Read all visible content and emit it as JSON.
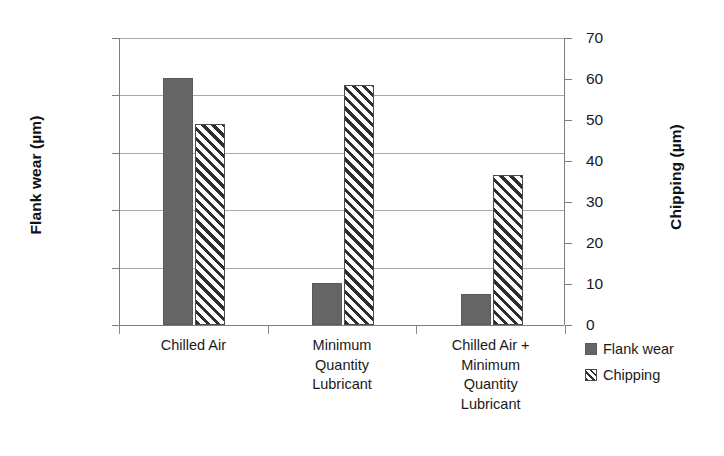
{
  "chart_data": {
    "type": "bar",
    "title": "",
    "xlabel": "",
    "categories": [
      "Chilled Air",
      "Minimum Quantity Lubricant",
      "Chilled Air + Minimum Quantity Lubricant"
    ],
    "category_lines": [
      [
        "Chilled Air"
      ],
      [
        "Minimum",
        "Quantity",
        "Lubricant"
      ],
      [
        "Chilled Air +",
        "Minimum",
        "Quantity",
        "Lubricant"
      ]
    ],
    "series": [
      {
        "name": "Flank wear",
        "axis": "left",
        "unit": "µm",
        "fill": "solid",
        "color": "#656565",
        "values": [
          1720,
          290,
          215
        ]
      },
      {
        "name": "Chipping",
        "axis": "right",
        "unit": "µm",
        "fill": "hatched",
        "color": "#2e2e2e",
        "values": [
          49,
          58.5,
          36.5
        ]
      }
    ],
    "left_axis": {
      "label": "Flank wear (µm)",
      "ticks": [
        0,
        400,
        800,
        1200,
        1600,
        2000
      ],
      "tick_labels": [
        "0",
        "400",
        "800",
        "1200",
        "1600",
        "2000"
      ],
      "ylim": [
        0,
        2000
      ]
    },
    "right_axis": {
      "label": "Chipping (µm)",
      "ticks": [
        0,
        10,
        20,
        30,
        40,
        50,
        60,
        70
      ],
      "tick_labels": [
        "0",
        "10",
        "20",
        "30",
        "40",
        "50",
        "60",
        "70"
      ],
      "ylim": [
        0,
        70
      ]
    },
    "grid": true,
    "legend": {
      "position": "right-bottom",
      "entries": [
        {
          "label": "Flank wear",
          "fill": "solid"
        },
        {
          "label": "Chipping",
          "fill": "hatched"
        }
      ]
    }
  }
}
